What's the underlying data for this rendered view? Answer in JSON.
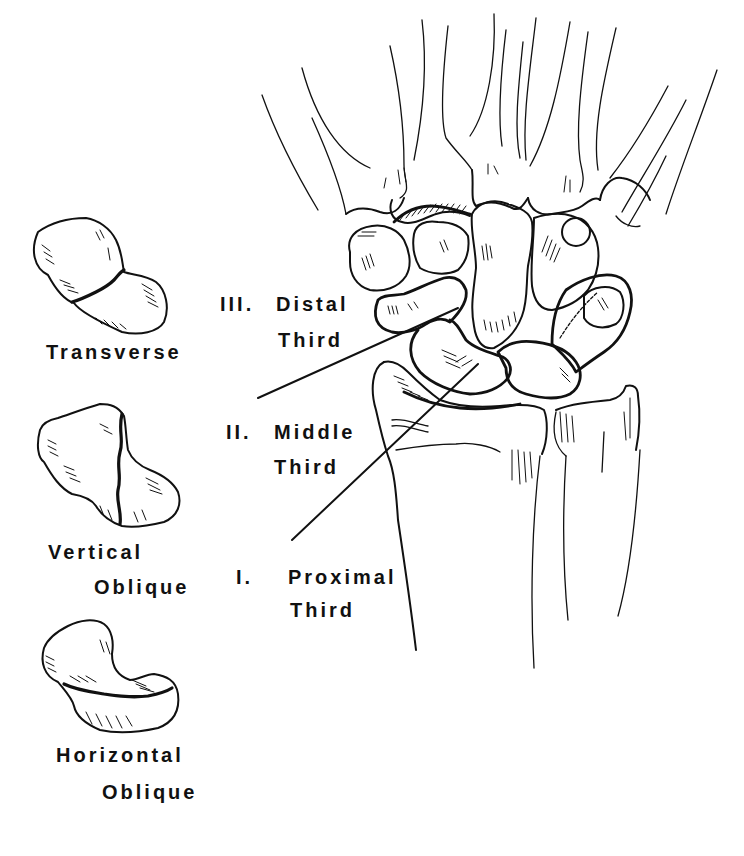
{
  "figure": {
    "ink_color": "#111111",
    "background": "#ffffff"
  },
  "fracture_types": [
    {
      "label": "Transverse"
    },
    {
      "label_line1": "Vertical",
      "label_line2": "Oblique"
    },
    {
      "label_line1": "Horizontal",
      "label_line2": "Oblique"
    }
  ],
  "locations": [
    {
      "numeral": "III.",
      "line1": "Distal",
      "line2": "Third"
    },
    {
      "numeral": "II.",
      "line1": "Middle",
      "line2": "Third"
    },
    {
      "numeral": "I.",
      "line1": "Proximal",
      "line2": "Third"
    }
  ]
}
